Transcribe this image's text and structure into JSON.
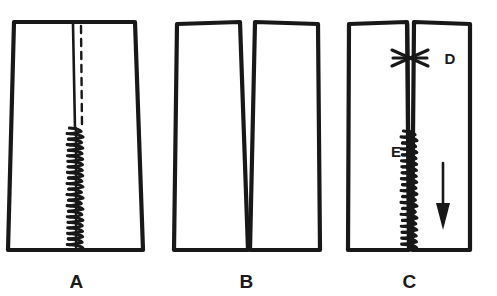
{
  "figure": {
    "background_color": "#ffffff",
    "ink_color": "#181818",
    "panel_count": 3
  },
  "panels": [
    {
      "id": "panel-a",
      "label": "A",
      "label_x": 76,
      "label_y": 288,
      "description": "Single tapered skirt panel with marked seam line and zigzag basted seam below the slit opening",
      "shape": "trapezoid-single-piece",
      "outline_points": "14,22 135,22 143,250 8,250",
      "features": [
        {
          "name": "seam-solid-line",
          "type": "solid-line",
          "x": 73,
          "y1": 24,
          "y2": 129
        },
        {
          "name": "seam-dashed-line",
          "type": "dashed-line",
          "x": 81,
          "y1": 26,
          "y2": 127
        },
        {
          "name": "basting-zigzag",
          "type": "zigzag-stitch",
          "x": 76,
          "y1": 128,
          "y2": 250,
          "steps": 22,
          "amplitude": 8
        }
      ]
    },
    {
      "id": "panel-b",
      "label": "B",
      "label_x": 246,
      "label_y": 288,
      "description": "Two separated skirt panel pieces shown apart, each cut along the seam line",
      "shape": "two-separate-pieces",
      "pieces": [
        {
          "name": "left-piece",
          "outline_points": "177,24 240,22 248,250 174,250"
        },
        {
          "name": "right-piece",
          "outline_points": "255,22 318,24 320,250 250,250"
        }
      ]
    },
    {
      "id": "panel-c",
      "label": "C",
      "label_x": 409,
      "label_y": 288,
      "description": "Panels rejoined: cross-basting mark at the slit top and zigzag basting down the seam, with arrow showing stitching direction",
      "shape": "two-pieces-joined",
      "pieces": [
        {
          "name": "left-piece",
          "outline_points": "349,24 407,22 409,250 348,250"
        },
        {
          "name": "right-piece",
          "outline_points": "414,22 470,24 470,250 412,250"
        }
      ],
      "features": [
        {
          "name": "seam-solid-line",
          "type": "solid-line",
          "x": 408,
          "y1": 24,
          "y2": 132
        },
        {
          "name": "seam-solid-line-inner",
          "type": "solid-line",
          "x": 413,
          "y1": 24,
          "y2": 120
        },
        {
          "name": "cross-basting-mark",
          "type": "x-mark",
          "x": 410,
          "y": 57,
          "half_width": 18,
          "half_height": 10
        },
        {
          "name": "basting-zigzag",
          "type": "zigzag-stitch",
          "x": 410,
          "y1": 131,
          "y2": 250,
          "steps": 20,
          "amplitude": 8
        },
        {
          "name": "direction-arrow",
          "type": "arrow-down",
          "x": 443,
          "y1": 163,
          "y2": 228
        }
      ],
      "callouts": [
        {
          "name": "callout-d",
          "label": "D",
          "x": 450,
          "y": 63,
          "refers_to": "cross-basting-mark"
        },
        {
          "name": "callout-e",
          "label": "E",
          "x": 396,
          "y": 157,
          "refers_to": "basting-zigzag"
        }
      ]
    }
  ]
}
